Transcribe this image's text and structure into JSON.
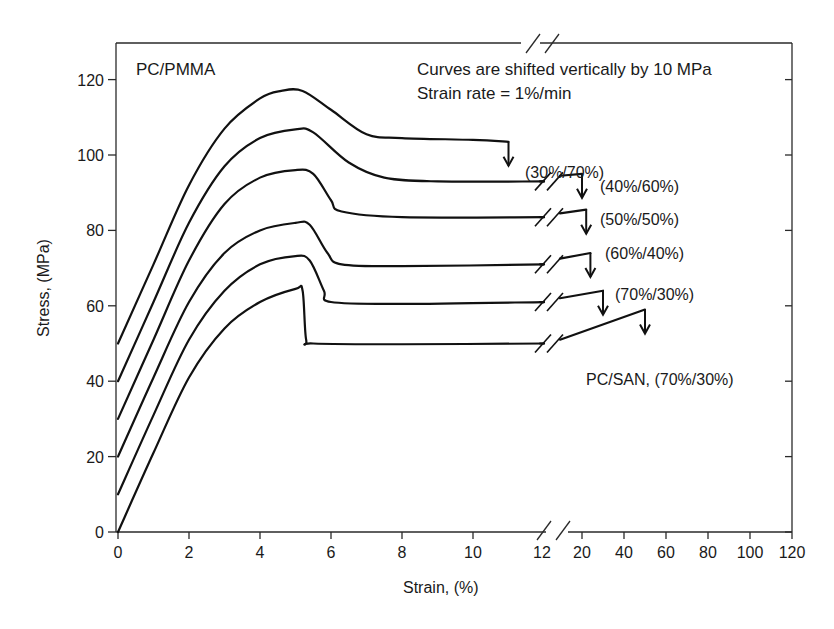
{
  "chart_data": {
    "type": "line",
    "title": "",
    "xlabel": "Strain, (%)",
    "ylabel": "Stress, (MPa)",
    "xlim": [
      0,
      120
    ],
    "ylim": [
      0,
      130
    ],
    "x_axis_break": {
      "from": 12,
      "to": 20
    },
    "x_ticks_left": [
      0,
      2,
      4,
      6,
      8,
      10,
      12
    ],
    "x_ticks_right": [
      20,
      40,
      60,
      80,
      100,
      120
    ],
    "y_ticks": [
      0,
      20,
      40,
      60,
      80,
      100,
      120
    ],
    "grid": false,
    "annotations": {
      "system_label": "PC/PMMA",
      "note_line1": "Curves are shifted vertically by 10 MPa",
      "note_line2": "Strain rate = 1%/min"
    },
    "series": [
      {
        "name": "(30%/70%)",
        "offset": 50,
        "points": [
          [
            0,
            50
          ],
          [
            1,
            71
          ],
          [
            2,
            92
          ],
          [
            3,
            107
          ],
          [
            4,
            115
          ],
          [
            4.6,
            117
          ],
          [
            5.2,
            117
          ],
          [
            6,
            112
          ],
          [
            7,
            105.5
          ],
          [
            8,
            104.5
          ],
          [
            10,
            104
          ],
          [
            11,
            103.5
          ]
        ],
        "break_strain": 11
      },
      {
        "name": "(40%/60%)",
        "offset": 40,
        "points": [
          [
            0,
            40
          ],
          [
            1,
            61
          ],
          [
            2,
            82
          ],
          [
            3,
            97
          ],
          [
            4,
            104.5
          ],
          [
            5,
            106.8
          ],
          [
            5.5,
            106
          ],
          [
            6.5,
            98
          ],
          [
            7.5,
            94
          ],
          [
            9,
            93
          ],
          [
            12,
            93
          ],
          [
            18,
            94.5
          ],
          [
            20,
            95
          ]
        ],
        "break_strain": 20
      },
      {
        "name": "(50%/50%)",
        "offset": 30,
        "points": [
          [
            0,
            30
          ],
          [
            1,
            51
          ],
          [
            2,
            72
          ],
          [
            3,
            87
          ],
          [
            4,
            94
          ],
          [
            5,
            96
          ],
          [
            5.5,
            95
          ],
          [
            6,
            88
          ],
          [
            6.3,
            85
          ],
          [
            8,
            83.5
          ],
          [
            12,
            83.5
          ],
          [
            18,
            84.5
          ],
          [
            22,
            85.5
          ]
        ],
        "break_strain": 22
      },
      {
        "name": "(60%/40%)",
        "offset": 20,
        "points": [
          [
            0,
            20
          ],
          [
            1,
            41
          ],
          [
            2,
            61
          ],
          [
            3,
            74
          ],
          [
            4,
            80
          ],
          [
            5,
            82
          ],
          [
            5.4,
            81.5
          ],
          [
            5.9,
            74
          ],
          [
            6.3,
            71
          ],
          [
            8,
            70.5
          ],
          [
            12,
            71
          ],
          [
            18,
            72.5
          ],
          [
            24,
            74
          ]
        ],
        "break_strain": 24
      },
      {
        "name": "(70%/30%)",
        "offset": 10,
        "points": [
          [
            0,
            10
          ],
          [
            1,
            31
          ],
          [
            2,
            51
          ],
          [
            3,
            64
          ],
          [
            4,
            71
          ],
          [
            5,
            73.2
          ],
          [
            5.4,
            72
          ],
          [
            5.8,
            64
          ],
          [
            6,
            61
          ],
          [
            8,
            60.5
          ],
          [
            12,
            61
          ],
          [
            18,
            62
          ],
          [
            30,
            64
          ]
        ],
        "break_strain": 30
      },
      {
        "name": "PC/SAN, (70%/30%)",
        "offset": 0,
        "points": [
          [
            0,
            0
          ],
          [
            1,
            21
          ],
          [
            2,
            41
          ],
          [
            3,
            54
          ],
          [
            4,
            61
          ],
          [
            5,
            64.5
          ],
          [
            5.2,
            64
          ],
          [
            5.3,
            51
          ],
          [
            5.5,
            50
          ],
          [
            8,
            49.8
          ],
          [
            12,
            50
          ],
          [
            18,
            51
          ],
          [
            50,
            59
          ]
        ],
        "break_strain": 50
      }
    ]
  }
}
